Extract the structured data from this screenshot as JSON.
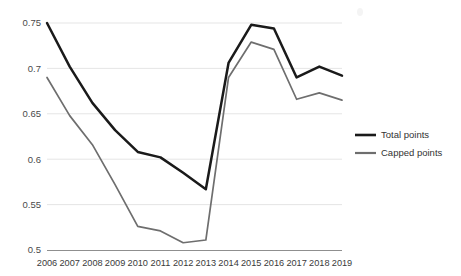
{
  "chart_data": {
    "type": "line",
    "title": "",
    "xlabel": "",
    "ylabel": "",
    "categories": [
      "2006",
      "2007",
      "2008",
      "2009",
      "2010",
      "2011",
      "2012",
      "2013",
      "2014",
      "2015",
      "2016",
      "2017",
      "2018",
      "2019"
    ],
    "ylim": [
      0.5,
      0.75
    ],
    "yticks": [
      0.5,
      0.55,
      0.6,
      0.65,
      0.7,
      0.75
    ],
    "ytick_labels": [
      "0.5",
      "0.55",
      "0.6",
      "0.65",
      "0.7",
      "0.75"
    ],
    "grid": true,
    "legend_position": "right",
    "series": [
      {
        "name": "Total points",
        "color": "#1a1a1a",
        "values": [
          0.75,
          0.702,
          0.662,
          0.632,
          0.608,
          0.602,
          0.585,
          0.567,
          0.706,
          0.748,
          0.744,
          0.69,
          0.702,
          0.692
        ]
      },
      {
        "name": "Capped points",
        "color": "#6e6e6e",
        "values": [
          0.69,
          0.648,
          0.616,
          0.572,
          0.526,
          0.521,
          0.508,
          0.511,
          0.69,
          0.729,
          0.721,
          0.666,
          0.673,
          0.665
        ]
      }
    ]
  },
  "legend": {
    "items": [
      {
        "label": "Total points",
        "color": "#1a1a1a"
      },
      {
        "label": "Capped points",
        "color": "#6e6e6e"
      }
    ]
  },
  "axes": {
    "y_labels": [
      "0.75",
      "0.7",
      "0.65",
      "0.6",
      "0.55",
      "0.5"
    ],
    "x_labels": [
      "2006",
      "2007",
      "2008",
      "2009",
      "2010",
      "2011",
      "2012",
      "2013",
      "2014",
      "2015",
      "2016",
      "2017",
      "2018",
      "2019"
    ]
  }
}
